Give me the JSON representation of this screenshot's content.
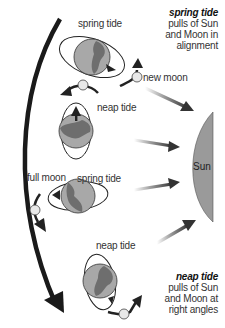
{
  "labels": {
    "spring_tide_top": "spring tide",
    "new_moon": "new moon",
    "neap_tide_upper": "neap tide",
    "full_moon": "full moon",
    "spring_tide_mid": "spring tide",
    "neap_tide_lower": "neap tide",
    "sun": "Sun"
  },
  "captions": {
    "spring": {
      "title": "spring tide",
      "line1": "pulls of Sun",
      "line2": "and Moon in",
      "line3": "alignment"
    },
    "neap": {
      "title": "neap tide",
      "line1": "pulls of Sun",
      "line2": "and Moon at",
      "line3": "right angles"
    }
  },
  "colors": {
    "sun_fill": "#9a9a9a",
    "earth_fill": "#a8a8a8",
    "land_fill": "#6e6e6e",
    "arrow_dark": "#3a3a3a",
    "orbit_arrow": "#1a1a1a"
  }
}
